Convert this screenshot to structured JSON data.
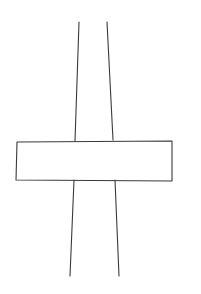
{
  "drawing": {
    "width": 201,
    "height": 294,
    "background": "#ffffff",
    "stroke_color": "#3a3a3a",
    "stroke_width": 1.1,
    "shapes": {
      "band_left_upper": {
        "x1": 79,
        "y1": 22,
        "x2": 75,
        "y2": 141
      },
      "band_right_upper": {
        "x1": 107,
        "y1": 22,
        "x2": 113,
        "y2": 140
      },
      "band_left_lower": {
        "x1": 74,
        "y1": 180,
        "x2": 70,
        "y2": 276
      },
      "band_right_lower": {
        "x1": 115,
        "y1": 180,
        "x2": 119,
        "y2": 276
      },
      "crossbar": "17,142 172,141 172,181 16,180"
    }
  }
}
